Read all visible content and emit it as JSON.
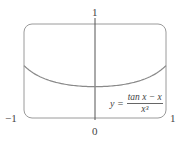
{
  "chart_data": {
    "type": "line",
    "title": "",
    "xlabel": "",
    "ylabel": "",
    "xlim": [
      -1,
      1
    ],
    "ylim": [
      0,
      1
    ],
    "grid": false,
    "tick_labels": {
      "x_left": "−1",
      "x_origin": "0",
      "x_right": "1",
      "y_top": "1"
    },
    "annotation": {
      "lhs": "y =",
      "numerator": "tan x − x",
      "denominator": "x³"
    },
    "series": [
      {
        "name": "y = (tan x − x)/x³",
        "x": [
          -1,
          -0.75,
          -0.5,
          -0.25,
          0,
          0.25,
          0.5,
          0.75,
          1
        ],
        "values": [
          0.557,
          0.418,
          0.358,
          0.34,
          0.333,
          0.34,
          0.358,
          0.418,
          0.557
        ]
      }
    ],
    "colors": {
      "curve": "#8a8a8a",
      "frame": "#8a8a8a",
      "axis": "#555555"
    }
  }
}
